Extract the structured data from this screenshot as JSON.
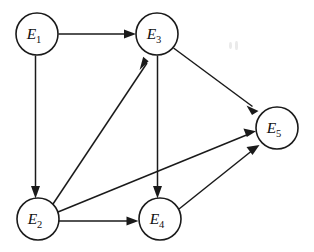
{
  "figure": {
    "background_color": "#ffffff",
    "stroke_color": "#1a1a1a",
    "width": 314,
    "height": 252
  },
  "graph": {
    "type": "directed-graph",
    "node_radius": 21,
    "nodes": [
      {
        "id": "E1",
        "base": "E",
        "subscript": "1",
        "label": "E1",
        "cx": 37,
        "cy": 34
      },
      {
        "id": "E2",
        "base": "E",
        "subscript": "2",
        "label": "E2",
        "cx": 38,
        "cy": 219
      },
      {
        "id": "E3",
        "base": "E",
        "subscript": "3",
        "label": "E3",
        "cx": 157,
        "cy": 34
      },
      {
        "id": "E4",
        "base": "E",
        "subscript": "4",
        "label": "E4",
        "cx": 160,
        "cy": 219
      },
      {
        "id": "E5",
        "base": "E",
        "subscript": "5",
        "label": "E5",
        "cx": 277,
        "cy": 128
      }
    ],
    "edges": [
      {
        "id": "e1-e3",
        "from": "E1",
        "to": "E3",
        "directed": true
      },
      {
        "id": "e1-e2",
        "from": "E1",
        "to": "E2",
        "directed": true
      },
      {
        "id": "e2-e3",
        "from": "E2",
        "to": "E3",
        "directed": true
      },
      {
        "id": "e2-e4",
        "from": "E2",
        "to": "E4",
        "directed": true
      },
      {
        "id": "e2-e5",
        "from": "E2",
        "to": "E5",
        "directed": true
      },
      {
        "id": "e3-e4",
        "from": "E3",
        "to": "E4",
        "directed": true
      },
      {
        "id": "e3-e5",
        "from": "E3",
        "to": "E5",
        "directed": true
      },
      {
        "id": "e4-e5",
        "from": "E4",
        "to": "E5",
        "directed": true
      }
    ]
  }
}
